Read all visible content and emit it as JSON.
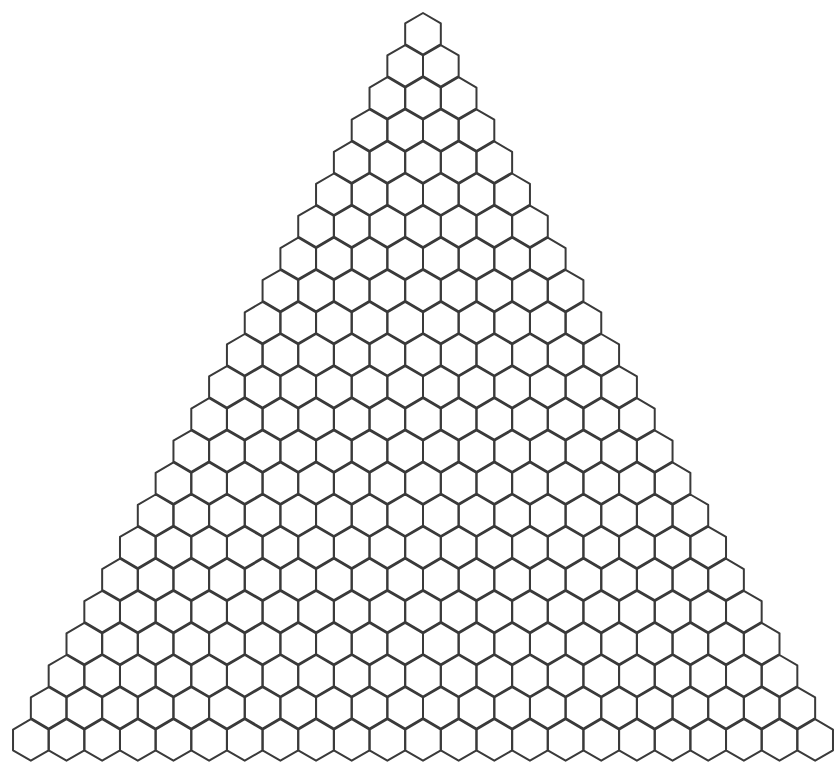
{
  "diagram": {
    "rows": 23,
    "hex_width": 35.65,
    "hex_height": 41.5,
    "row_step": 32.1,
    "apex_x": 423,
    "apex_y": 13,
    "stroke_color": "#3a3a3a",
    "background_color": "#ffffff"
  }
}
